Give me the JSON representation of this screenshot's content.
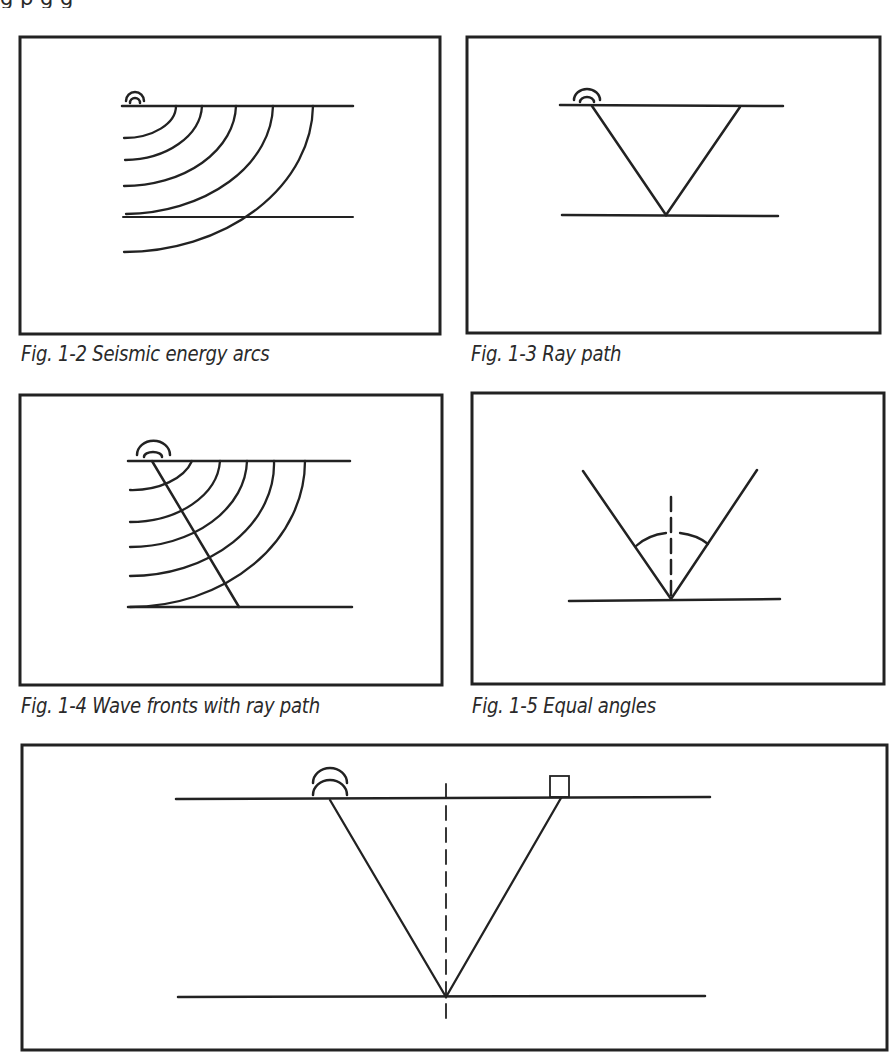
{
  "page": {
    "top_text_fragment": "g                p                    g          g"
  },
  "figures": [
    {
      "id": "fig-1-2",
      "caption": "Fig. 1-2 Seismic energy arcs",
      "elements": [
        "source-symbol",
        "surface-line",
        "reflector-line",
        "wavefront-arcs x5"
      ]
    },
    {
      "id": "fig-1-3",
      "caption": "Fig. 1-3 Ray path",
      "elements": [
        "source-symbol",
        "surface-line",
        "reflector-line",
        "v-ray-path"
      ]
    },
    {
      "id": "fig-1-4",
      "caption": "Fig. 1-4 Wave fronts with ray path",
      "elements": [
        "source-symbol",
        "surface-line",
        "reflector-line",
        "wavefront-arcs x5",
        "ray-line"
      ]
    },
    {
      "id": "fig-1-5",
      "caption": "Fig. 1-5 Equal angles",
      "elements": [
        "reflector-line",
        "incident-ray",
        "reflected-ray",
        "dashed-normal",
        "angle-arcs"
      ]
    },
    {
      "id": "fig-1-6",
      "caption": "",
      "elements": [
        "source-symbol",
        "receiver-box",
        "surface-line",
        "reflector-line",
        "v-ray-path",
        "dashed-normal"
      ]
    }
  ],
  "style": {
    "line_color": "#222222",
    "frame_color": "#2a2a2a",
    "background": "#ffffff"
  }
}
